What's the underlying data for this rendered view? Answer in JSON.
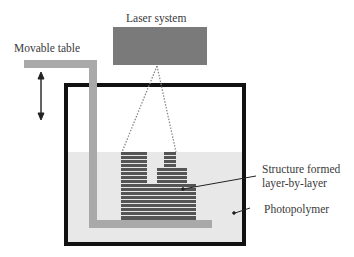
{
  "diagram": {
    "labels": {
      "laser": "Laser system",
      "table": "Movable table",
      "structure_line1": "Structure formed",
      "structure_line2": "layer-by-layer",
      "photopolymer": "Photopolymer"
    },
    "colors": {
      "laser_box": "#7a7a7a",
      "container_border": "#111111",
      "liquid": "#e8e8e8",
      "table": "#a9a9a9",
      "layers": "#555555",
      "text": "#3a3a3a"
    }
  }
}
